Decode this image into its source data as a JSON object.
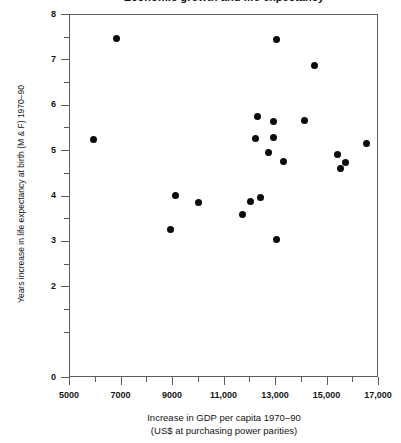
{
  "chart_data": {
    "type": "scatter",
    "title": "Economic growth and life expectancy",
    "xlabel_line1": "Increase in GDP per capita 1970–90",
    "xlabel_line2": "(US$ at purchasing power parities)",
    "ylabel": "Years increase in life expectancy at birth (M & F) 1970–90",
    "xlim": [
      5000,
      17000
    ],
    "ylim": [
      0,
      8
    ],
    "x_ticks_major": [
      5000,
      7000,
      9000,
      11000,
      13000,
      15000,
      17000
    ],
    "x_tick_labels": [
      "5000",
      "7000",
      "9000",
      "11,000",
      "13,000",
      "15,000",
      "17,000"
    ],
    "x_ticks_minor": [
      6000,
      8000,
      10000,
      12000,
      14000,
      16000
    ],
    "y_ticks_major": [
      0,
      2,
      3,
      4,
      5,
      6,
      7,
      8
    ],
    "y_tick_labels": [
      "0",
      "2",
      "3",
      "4",
      "5",
      "6",
      "7",
      "8"
    ],
    "y_ticks_minor": [
      1,
      1.5,
      2.5,
      3.5,
      4.5,
      5.5,
      6.5,
      7.5
    ],
    "grid": false,
    "legend": false,
    "marker": "filled-circle",
    "marker_color": "#0a0a0a",
    "points": [
      {
        "x": 5900,
        "y": 5.25
      },
      {
        "x": 6800,
        "y": 7.48
      },
      {
        "x": 8900,
        "y": 3.28
      },
      {
        "x": 9100,
        "y": 4.03
      },
      {
        "x": 10000,
        "y": 3.87
      },
      {
        "x": 11700,
        "y": 3.6
      },
      {
        "x": 12200,
        "y": 5.28
      },
      {
        "x": 12000,
        "y": 3.9
      },
      {
        "x": 12300,
        "y": 5.77
      },
      {
        "x": 12700,
        "y": 4.97
      },
      {
        "x": 12400,
        "y": 3.97
      },
      {
        "x": 13000,
        "y": 7.45
      },
      {
        "x": 12900,
        "y": 5.65
      },
      {
        "x": 12900,
        "y": 5.3
      },
      {
        "x": 13000,
        "y": 3.05
      },
      {
        "x": 13300,
        "y": 4.78
      },
      {
        "x": 14100,
        "y": 5.67
      },
      {
        "x": 14500,
        "y": 6.88
      },
      {
        "x": 15400,
        "y": 4.92
      },
      {
        "x": 15500,
        "y": 4.62
      },
      {
        "x": 15700,
        "y": 4.75
      },
      {
        "x": 16500,
        "y": 5.17
      }
    ]
  }
}
